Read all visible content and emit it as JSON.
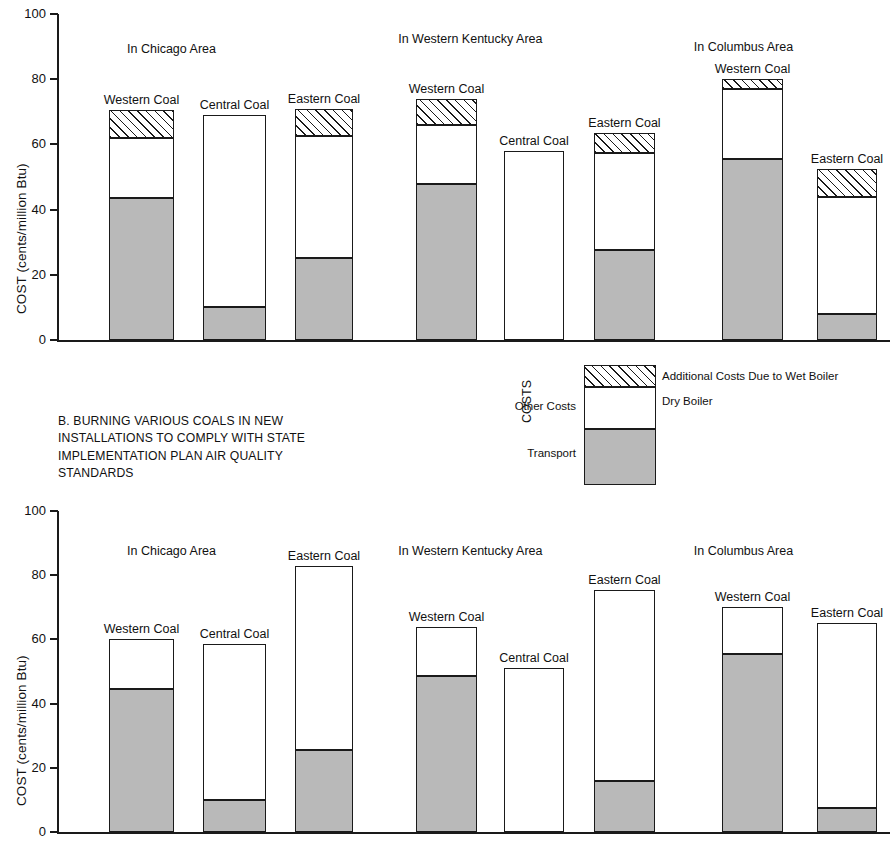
{
  "axis": {
    "y_label": "COST (cents/million Btu)",
    "ticks": [
      "100",
      "80",
      "60",
      "40",
      "20",
      "0"
    ],
    "tick_values": [
      100,
      80,
      60,
      40,
      20,
      0
    ]
  },
  "legend": {
    "axis_label": "COSTS",
    "other_costs_label": "Other Costs",
    "transport_label": "Transport",
    "wet_label": "Additional Costs Due to Wet Boiler",
    "dry_label": "Dry Boiler"
  },
  "caption": {
    "line1": "B. BURNING VARIOUS COALS IN NEW",
    "line2": "INSTALLATIONS TO COMPLY WITH STATE",
    "line3": "IMPLEMENTATION PLAN AIR QUALITY",
    "line4": "STANDARDS"
  },
  "colors": {
    "transport": "#b9b9b9",
    "dry_boiler": "#ffffff",
    "wet_boiler_hatch": "#1a1a1a",
    "axis": "#1a1a1a"
  },
  "chart_data": [
    {
      "id": "chart-a",
      "type": "bar",
      "stacked": true,
      "title": "",
      "xlabel": "",
      "ylabel": "COST (cents/million Btu)",
      "ylim": [
        0,
        100
      ],
      "yticks": [
        0,
        20,
        40,
        60,
        80,
        100
      ],
      "grid": false,
      "legend_position": "below-center",
      "group_labels": [
        "In Chicago Area",
        "In Western Kentucky Area",
        "In Columbus Area"
      ],
      "categories": [
        "Western Coal",
        "Central Coal",
        "Eastern Coal",
        "Western Coal",
        "Central Coal",
        "Eastern Coal",
        "Western Coal",
        "Eastern Coal"
      ],
      "groups": [
        0,
        0,
        0,
        1,
        1,
        1,
        2,
        2
      ],
      "series": [
        {
          "name": "Transport",
          "values": [
            43.5,
            10.0,
            25.0,
            48.0,
            0,
            27.5,
            55.5,
            8.0
          ]
        },
        {
          "name": "Dry Boiler",
          "values": [
            18.5,
            59.0,
            37.5,
            18.0,
            58.0,
            30.0,
            21.5,
            36.0
          ]
        },
        {
          "name": "Additional Costs Due to Wet Boiler",
          "values": [
            8.5,
            0,
            8.5,
            8.0,
            0,
            6.0,
            3.0,
            8.5
          ]
        }
      ],
      "totals": [
        70.5,
        69.0,
        71.0,
        74.0,
        58.0,
        63.5,
        80.0,
        52.5
      ]
    },
    {
      "id": "chart-b",
      "type": "bar",
      "stacked": true,
      "title": "",
      "xlabel": "",
      "ylabel": "COST (cents/million Btu)",
      "ylim": [
        0,
        100
      ],
      "yticks": [
        0,
        20,
        40,
        60,
        80,
        100
      ],
      "grid": false,
      "legend_position": "above-center",
      "group_labels": [
        "In Chicago Area",
        "In Western Kentucky Area",
        "In Columbus Area"
      ],
      "categories": [
        "Western Coal",
        "Central Coal",
        "Eastern Coal",
        "Western Coal",
        "Central Coal",
        "Eastern Coal",
        "Western Coal",
        "Eastern Coal"
      ],
      "groups": [
        0,
        0,
        0,
        1,
        1,
        1,
        2,
        2
      ],
      "series": [
        {
          "name": "Transport",
          "values": [
            44.5,
            10.0,
            25.5,
            48.5,
            0,
            16.0,
            55.5,
            7.5
          ]
        },
        {
          "name": "Dry Boiler",
          "values": [
            15.5,
            48.5,
            57.5,
            15.5,
            51.0,
            59.5,
            14.5,
            57.5
          ]
        },
        {
          "name": "Additional Costs Due to Wet Boiler",
          "values": [
            0,
            0,
            0,
            0,
            0,
            0,
            0,
            0
          ]
        }
      ],
      "totals": [
        60.0,
        58.5,
        83.0,
        64.0,
        51.0,
        75.5,
        70.0,
        65.0
      ]
    }
  ]
}
